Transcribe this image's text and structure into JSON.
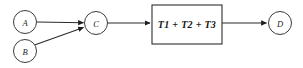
{
  "diagram": {
    "type": "flow-diagram",
    "background_color": "#ffffff",
    "stroke_color": "#2b2b2b",
    "nodes": [
      {
        "id": "A",
        "label": "A",
        "shape": "circle",
        "cx": 25,
        "cy": 22,
        "r": 11.5
      },
      {
        "id": "B",
        "label": "B",
        "shape": "circle",
        "cx": 25,
        "cy": 51,
        "r": 11.5
      },
      {
        "id": "C",
        "label": "C",
        "shape": "circle",
        "cx": 96,
        "cy": 23,
        "r": 11.5
      },
      {
        "id": "D",
        "label": "D",
        "shape": "circle",
        "cx": 280,
        "cy": 23,
        "r": 11.5
      }
    ],
    "process": {
      "id": "T",
      "label": "T1 + T2 + T3",
      "shape": "rectangle",
      "x": 152,
      "y": 5,
      "width": 70,
      "height": 39
    },
    "edges": [
      {
        "id": "a-to-c",
        "from": "A",
        "to": "C",
        "arrowhead": true
      },
      {
        "id": "b-to-c",
        "from": "B",
        "to": "C",
        "arrowhead": true
      },
      {
        "id": "c-to-t",
        "from": "C",
        "to": "T",
        "arrowhead": true
      },
      {
        "id": "t-to-d",
        "from": "T",
        "to": "D",
        "arrowhead": true
      }
    ]
  }
}
